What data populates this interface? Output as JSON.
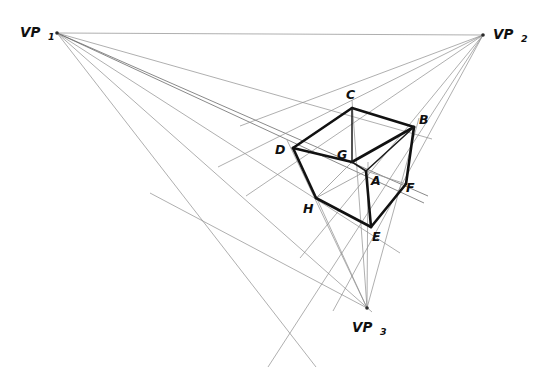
{
  "figure": {
    "background_color": "#ffffff",
    "line_color_construction": "#8d8d8d",
    "line_color_edge": "#111111",
    "label_color": "#101010",
    "width": 544,
    "height": 367
  },
  "vanishing_points": [
    {
      "id": "VP1",
      "base": "VP",
      "sub": "1",
      "x": 57,
      "y": 33,
      "label_x": 20,
      "label_y": 37,
      "sub_x": 48,
      "sub_y": 40
    },
    {
      "id": "VP2",
      "base": "VP",
      "sub": "2",
      "x": 483,
      "y": 35,
      "label_x": 493,
      "label_y": 39,
      "sub_x": 521,
      "sub_y": 42
    },
    {
      "id": "VP3",
      "base": "VP",
      "sub": "3",
      "x": 367,
      "y": 308,
      "label_x": 352,
      "label_y": 332,
      "sub_x": 380,
      "sub_y": 335
    }
  ],
  "vertices": [
    {
      "id": "A",
      "x": 366,
      "y": 171,
      "label_x": 371,
      "label_y": 185
    },
    {
      "id": "B",
      "x": 414,
      "y": 127,
      "label_x": 419,
      "label_y": 124
    },
    {
      "id": "C",
      "x": 352,
      "y": 108,
      "label_x": 346,
      "label_y": 99
    },
    {
      "id": "D",
      "x": 293,
      "y": 148,
      "label_x": 275,
      "label_y": 154
    },
    {
      "id": "E",
      "x": 371,
      "y": 227,
      "label_x": 372,
      "label_y": 241
    },
    {
      "id": "F",
      "x": 406,
      "y": 184,
      "label_x": 406,
      "label_y": 192
    },
    {
      "id": "G",
      "x": 352,
      "y": 162,
      "label_x": 339,
      "label_y": 159
    },
    {
      "id": "H",
      "x": 316,
      "y": 198,
      "label_x": 305,
      "label_y": 213
    }
  ],
  "cube_edges": [
    {
      "from": "C",
      "to": "D",
      "style": "solid"
    },
    {
      "from": "C",
      "to": "B",
      "style": "solid"
    },
    {
      "from": "D",
      "to": "H",
      "style": "solid"
    },
    {
      "from": "B",
      "to": "F",
      "style": "solid"
    },
    {
      "from": "H",
      "to": "E",
      "style": "solid"
    },
    {
      "from": "F",
      "to": "E",
      "style": "solid"
    },
    {
      "from": "C",
      "to": "G",
      "style": "thin"
    },
    {
      "from": "G",
      "to": "D",
      "style": "solid"
    },
    {
      "from": "G",
      "to": "B",
      "style": "solid"
    },
    {
      "from": "A",
      "to": "E",
      "style": "solid"
    },
    {
      "from": "A",
      "to": "G",
      "style": "thin"
    },
    {
      "from": "A",
      "to": "B",
      "style": "thin"
    }
  ],
  "hidden_edges": [
    {
      "from": "G",
      "to": "H",
      "style": "hidden"
    },
    {
      "from": "A",
      "to": "F",
      "style": "hidden"
    },
    {
      "from": "H",
      "to": "A",
      "style": "hidden"
    }
  ],
  "construction_lines": {
    "from_vp1": [
      {
        "to_x": 483,
        "to_y": 35,
        "note": "horizon to VP2"
      },
      {
        "to_x": 414,
        "to_y": 127,
        "note": "through C to B"
      },
      {
        "to_x": 406,
        "to_y": 184,
        "note": "through G to A/F"
      },
      {
        "to_x": 371,
        "to_y": 227,
        "note": "through H to E"
      },
      {
        "to_x": 367,
        "to_y": 308,
        "note": "through H toward VP3"
      },
      {
        "to_x": 330,
        "to_y": 367,
        "note": "lower ray"
      }
    ],
    "from_vp2": [
      {
        "to_x": 293,
        "to_y": 148,
        "note": "through C to D"
      },
      {
        "to_x": 316,
        "to_y": 198,
        "note": "through G to D area"
      },
      {
        "to_x": 352,
        "to_y": 162,
        "note": "through A to G"
      },
      {
        "to_x": 371,
        "to_y": 227,
        "note": "through F to E"
      },
      {
        "to_x": 345,
        "to_y": 290,
        "note": "lower ray"
      },
      {
        "to_x": 300,
        "to_y": 367,
        "note": "far lower ray"
      }
    ],
    "from_vp3": [
      {
        "to_x": 352,
        "to_y": 108,
        "note": "through G to C"
      },
      {
        "to_x": 293,
        "to_y": 148,
        "note": "through H to D"
      },
      {
        "to_x": 414,
        "to_y": 127,
        "note": "through F to B"
      },
      {
        "to_x": 316,
        "to_y": 198,
        "note": "to H"
      },
      {
        "to_x": 366,
        "to_y": 171,
        "note": "to A"
      },
      {
        "to_x": 160,
        "to_y": 200,
        "note": "long left ray"
      }
    ]
  }
}
